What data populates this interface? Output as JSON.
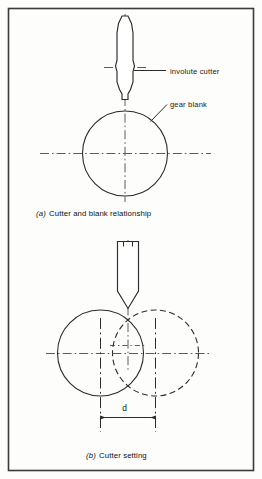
{
  "figure": {
    "border_color": "#3b3b3b",
    "line_color": "#2b2b2b",
    "background": "#fdfdfc",
    "panels": [
      {
        "id": "a",
        "caption_tag": "(a)",
        "caption_text": "Cutter and blank relationship",
        "annotations": [
          {
            "id": "involute-cutter",
            "text": "involute cutter"
          },
          {
            "id": "gear-blank",
            "text": "gear blank"
          }
        ],
        "parts": [
          {
            "id": "cutter",
            "shape": "involute-cutter-profile"
          },
          {
            "id": "blank",
            "shape": "circle",
            "style": "solid"
          }
        ]
      },
      {
        "id": "b",
        "caption_tag": "(b)",
        "caption_text": "Cutter setting",
        "annotations": [
          {
            "id": "offset-dimension",
            "text": "d"
          }
        ],
        "parts": [
          {
            "id": "cutter",
            "shape": "cutter-body-pointed"
          },
          {
            "id": "blank-first-position",
            "shape": "circle",
            "style": "solid"
          },
          {
            "id": "blank-second-position",
            "shape": "circle",
            "style": "dashed"
          }
        ]
      }
    ]
  }
}
